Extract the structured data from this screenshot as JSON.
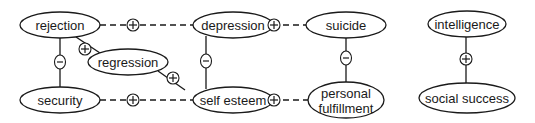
{
  "diagram": {
    "type": "causal-loop-diagram",
    "colors": {
      "stroke": "#1a1a1a",
      "background": "#ffffff"
    },
    "nodes": [
      {
        "id": "rejection",
        "label": "rejection",
        "cx": 60,
        "cy": 25,
        "rx": 40,
        "ry": 13
      },
      {
        "id": "security",
        "label": "security",
        "cx": 60,
        "cy": 100,
        "rx": 40,
        "ry": 13
      },
      {
        "id": "regression",
        "label": "regression",
        "cx": 128,
        "cy": 62,
        "rx": 40,
        "ry": 13
      },
      {
        "id": "depression",
        "label": "depression",
        "cx": 233,
        "cy": 25,
        "rx": 40,
        "ry": 13
      },
      {
        "id": "self-esteem",
        "label": "self esteem",
        "cx": 233,
        "cy": 100,
        "rx": 40,
        "ry": 13
      },
      {
        "id": "suicide",
        "label": "suicide",
        "cx": 346,
        "cy": 25,
        "rx": 40,
        "ry": 13
      },
      {
        "id": "personal-fulfillment",
        "label_line1": "personal",
        "label_line2": "fulfillment",
        "cx": 346,
        "cy": 100,
        "rx": 38,
        "ry": 18
      },
      {
        "id": "intelligence",
        "label": "intelligence",
        "cx": 467,
        "cy": 24,
        "rx": 39,
        "ry": 13
      },
      {
        "id": "social-success",
        "label": "social success",
        "cx": 467,
        "cy": 98,
        "rx": 48,
        "ry": 15
      }
    ],
    "edges": [
      {
        "from": "rejection",
        "to": "depression",
        "sign": "+",
        "style": "dashed"
      },
      {
        "from": "security",
        "to": "self-esteem",
        "sign": "+",
        "style": "dashed"
      },
      {
        "from": "depression",
        "to": "suicide",
        "sign": "+",
        "style": "dashed"
      },
      {
        "from": "self-esteem",
        "to": "personal-fulfillment",
        "sign": "+",
        "style": "dashed"
      },
      {
        "from": "rejection",
        "to": "security",
        "sign": "-",
        "style": "solid"
      },
      {
        "from": "rejection",
        "to": "regression",
        "sign": "+",
        "style": "solid"
      },
      {
        "from": "regression",
        "to": "self-esteem",
        "sign": "+",
        "style": "solid"
      },
      {
        "from": "depression",
        "to": "self-esteem",
        "sign": "-",
        "style": "solid"
      },
      {
        "from": "suicide",
        "to": "personal-fulfillment",
        "sign": "-",
        "style": "solid"
      },
      {
        "from": "intelligence",
        "to": "social-success",
        "sign": "+",
        "style": "solid"
      }
    ]
  }
}
